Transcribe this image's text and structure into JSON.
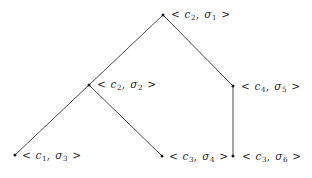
{
  "figure": {
    "type": "tree-diagram",
    "background_color": "#ffffff",
    "line_color": "#3a3a3a",
    "text_color": "#2b2b2b",
    "width": 312,
    "height": 178
  },
  "nodes": [
    {
      "id": "n1",
      "label": "< c2, σ1 >",
      "config": "c",
      "config_index": "2",
      "state": "σ",
      "state_index": "1",
      "x": 163,
      "y": 15,
      "label_x": 170,
      "label_y": 9
    },
    {
      "id": "n2",
      "label": "< c2, σ2 >",
      "config": "c",
      "config_index": "2",
      "state": "σ",
      "state_index": "2",
      "x": 89,
      "y": 85,
      "label_x": 96,
      "label_y": 79
    },
    {
      "id": "n3",
      "label": "< c4, σ5 >",
      "config": "c",
      "config_index": "4",
      "state": "σ",
      "state_index": "5",
      "x": 233,
      "y": 86,
      "label_x": 240,
      "label_y": 81
    },
    {
      "id": "n4",
      "label": "< c1, σ3 >",
      "config": "c",
      "config_index": "1",
      "state": "σ",
      "state_index": "3",
      "x": 15,
      "y": 155,
      "label_x": 21,
      "label_y": 150
    },
    {
      "id": "n5",
      "label": "< c3, σ4 >",
      "config": "c",
      "config_index": "3",
      "state": "σ",
      "state_index": "4",
      "x": 162,
      "y": 156,
      "label_x": 168,
      "label_y": 151
    },
    {
      "id": "n6",
      "label": "< c3, σ6 >",
      "config": "c",
      "config_index": "3",
      "state": "σ",
      "state_index": "6",
      "x": 233,
      "y": 156,
      "label_x": 241,
      "label_y": 151
    }
  ],
  "edges": [
    {
      "id": "e1",
      "from": "n1",
      "to": "n2",
      "x1": 163,
      "y1": 15,
      "x2": 89,
      "y2": 85
    },
    {
      "id": "e2",
      "from": "n1",
      "to": "n3",
      "x1": 163,
      "y1": 15,
      "x2": 233,
      "y2": 86
    },
    {
      "id": "e3",
      "from": "n2",
      "to": "n4",
      "x1": 89,
      "y1": 85,
      "x2": 15,
      "y2": 155
    },
    {
      "id": "e4",
      "from": "n2",
      "to": "n5",
      "x1": 89,
      "y1": 85,
      "x2": 162,
      "y2": 156
    },
    {
      "id": "e5",
      "from": "n3",
      "to": "n6",
      "x1": 233,
      "y1": 87,
      "x2": 233,
      "y2": 156
    }
  ],
  "symbols": {
    "open_angle": "<",
    "close_angle": ">",
    "comma": ","
  }
}
